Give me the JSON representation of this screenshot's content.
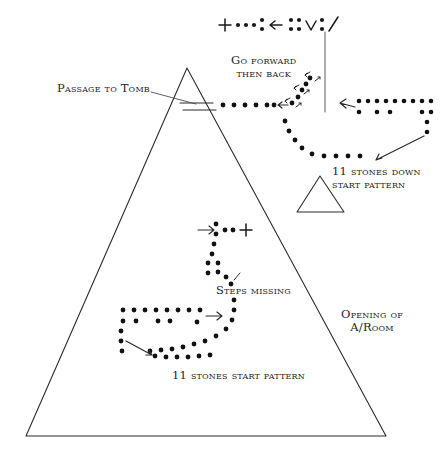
{
  "diagram": {
    "ink_color": "#2b2b2b",
    "stone_color": "#111111",
    "background": "#ffffff"
  },
  "labels": {
    "passage_to_tomb": "Passage to Tomb",
    "go_forward_then_back": "Go forward\nthen back",
    "eleven_stones_down": "11 stones down\nstart pattern",
    "steps_missing": "Steps missing",
    "opening_of_aroom": "Opening of\nA/Room",
    "eleven_stones_start": "11 stones start pattern"
  },
  "symbol_row": {
    "description": "Top legend row of hand-drawn glyphs",
    "glyphs": [
      "plus",
      "dot",
      "dot",
      "dot",
      "dot-pair-vertical",
      "left-arrow",
      "dot-pair-vertical",
      "dot-pair-vertical",
      "vee",
      "dot-pair-vertical",
      "slash"
    ]
  },
  "shapes": {
    "pyramid": {
      "apex": [
        187,
        68
      ],
      "base_left": [
        26,
        436
      ],
      "base_right": [
        386,
        436
      ]
    },
    "small_triangle": {
      "apex": [
        320,
        176
      ],
      "base_left": [
        297,
        212
      ],
      "base_right": [
        344,
        212
      ]
    },
    "passage_marks": {
      "count": 2,
      "description": "two short parallel horizontal lines crossing the pyramid face"
    },
    "vertical_rule": {
      "x": 325,
      "y_top": 32,
      "y_bottom": 112
    }
  },
  "patterns": {
    "upper_right_trail": {
      "name": "11 stones down start pattern",
      "stone_count": 11
    },
    "forward_back_zigzag": {
      "name": "Go forward then back",
      "arrow_pairs": 3
    },
    "middle_trail": {
      "name": "Steps missing"
    },
    "lower_left_trail": {
      "name": "11 stones start pattern",
      "stone_count": 11
    }
  }
}
